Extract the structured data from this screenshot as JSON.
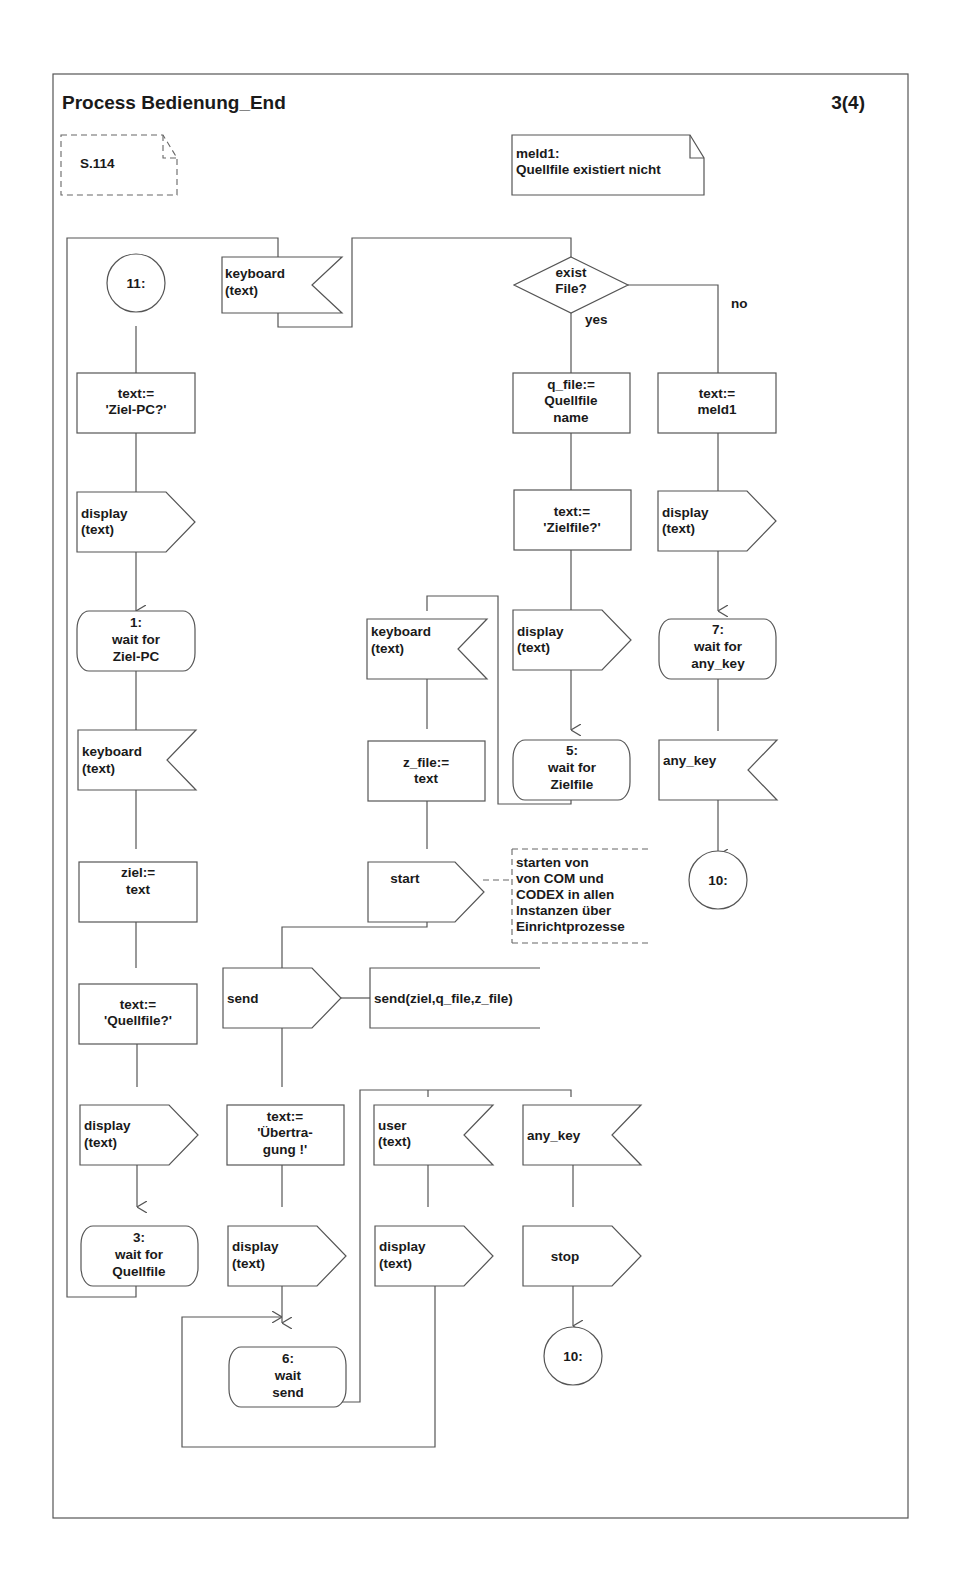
{
  "header": {
    "title": "Process Bedienung_End",
    "page": "3(4)"
  },
  "comments": {
    "ref": "S.114",
    "meld_line1": "meld1:",
    "meld_line2": "Quellfile existiert nicht",
    "start_note": [
      "starten von",
      "von COM und",
      "CODEX in allen",
      "Instanzen über",
      "Einrichtprozesse"
    ],
    "send_note": "send(ziel,q_file,z_file)"
  },
  "left_column": {
    "connector_11": "11:",
    "task1": [
      "text:=",
      "'Ziel-PC?'"
    ],
    "output1": [
      "display",
      "(text)"
    ],
    "state1": [
      "1:",
      "wait for",
      "Ziel-PC"
    ],
    "input1": [
      "keyboard",
      "(text)"
    ],
    "task2": [
      "ziel:=",
      "text"
    ],
    "task3": [
      "text:=",
      "'Quellfile?'"
    ],
    "output2": [
      "display",
      "(text)"
    ],
    "state3": [
      "3:",
      "wait for",
      "Quellfile"
    ]
  },
  "top_branch": {
    "input_keyboard": [
      "keyboard",
      "(text)"
    ],
    "decision": [
      "exist",
      "File?"
    ],
    "yes_label": "yes",
    "no_label": "no"
  },
  "yes_branch": {
    "task_qfile": [
      "q_file:=",
      "Quellfile",
      "name"
    ],
    "task_zielfile": [
      "text:=",
      "'Zielfile?'"
    ],
    "output_display": [
      "display",
      "(text)"
    ],
    "state5": [
      "5:",
      "wait for",
      "Zielfile"
    ]
  },
  "no_branch": {
    "task_meld": [
      "text:=",
      "meld1"
    ],
    "output_display": [
      "display",
      "(text)"
    ],
    "state7": [
      "7:",
      "wait for",
      "any_key"
    ],
    "input_anykey": "any_key",
    "connector_10": "10:"
  },
  "middle_column": {
    "input_keyboard": [
      "keyboard",
      "(text)"
    ],
    "task_zfile": [
      "z_file:=",
      "text"
    ],
    "output_start": "start",
    "output_send": "send",
    "task_uebertragung": [
      "text:=",
      "'Übertra-",
      "gung !'"
    ],
    "output_display": [
      "display",
      "(text)"
    ],
    "state6": [
      "6:",
      "wait",
      "send"
    ]
  },
  "state6_branches": {
    "input_user": [
      "user",
      "(text)"
    ],
    "output_display": [
      "display",
      "(text)"
    ],
    "input_anykey": "any_key",
    "output_stop": "stop",
    "connector_10": "10:"
  }
}
